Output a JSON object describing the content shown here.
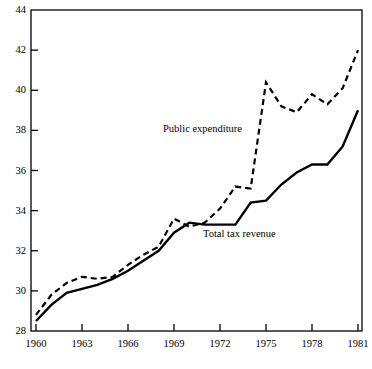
{
  "chart_data": {
    "type": "line",
    "title": "",
    "subtitle": "",
    "xlabel": "",
    "ylabel": "",
    "xlim": [
      1960,
      1981
    ],
    "ylim": [
      28,
      44
    ],
    "yticks": [
      28,
      30,
      32,
      34,
      36,
      38,
      40,
      42,
      44
    ],
    "xticks": [
      1960,
      1963,
      1966,
      1969,
      1972,
      1975,
      1978,
      1981
    ],
    "xtick_labels": [
      "1960",
      "1963",
      "1966",
      "1969",
      "1972",
      "1975",
      "1978",
      "1981"
    ],
    "ytick_labels": [
      "28",
      "30",
      "32",
      "34",
      "36",
      "38",
      "40",
      "42",
      "44"
    ],
    "grid": false,
    "legend_position": "inline-annotation",
    "x": [
      1960,
      1961,
      1962,
      1963,
      1964,
      1965,
      1966,
      1967,
      1968,
      1969,
      1970,
      1971,
      1972,
      1973,
      1974,
      1975,
      1976,
      1977,
      1978,
      1979,
      1980,
      1981
    ],
    "series": [
      {
        "name": "Public expenditure",
        "style": "dashed",
        "color": "#000000",
        "values": [
          28.8,
          29.8,
          30.4,
          30.7,
          30.6,
          30.7,
          31.3,
          31.8,
          32.2,
          33.6,
          33.2,
          33.4,
          34.1,
          35.2,
          35.1,
          40.4,
          39.2,
          38.9,
          39.8,
          39.3,
          40.1,
          42.0
        ]
      },
      {
        "name": "Total tax revenue",
        "style": "solid",
        "color": "#000000",
        "values": [
          28.5,
          29.3,
          29.9,
          30.1,
          30.3,
          30.6,
          31.0,
          31.5,
          32.0,
          32.9,
          33.4,
          33.3,
          33.3,
          33.3,
          34.4,
          34.5,
          35.3,
          35.9,
          36.3,
          36.3,
          37.2,
          39.0
        ]
      }
    ],
    "annotations": [
      {
        "text": "Public expenditure",
        "x_px": 163,
        "y_px": 130,
        "anchor": "start"
      },
      {
        "text": "Total tax revenue",
        "x_px": 203,
        "y_px": 235,
        "anchor": "start"
      }
    ]
  }
}
